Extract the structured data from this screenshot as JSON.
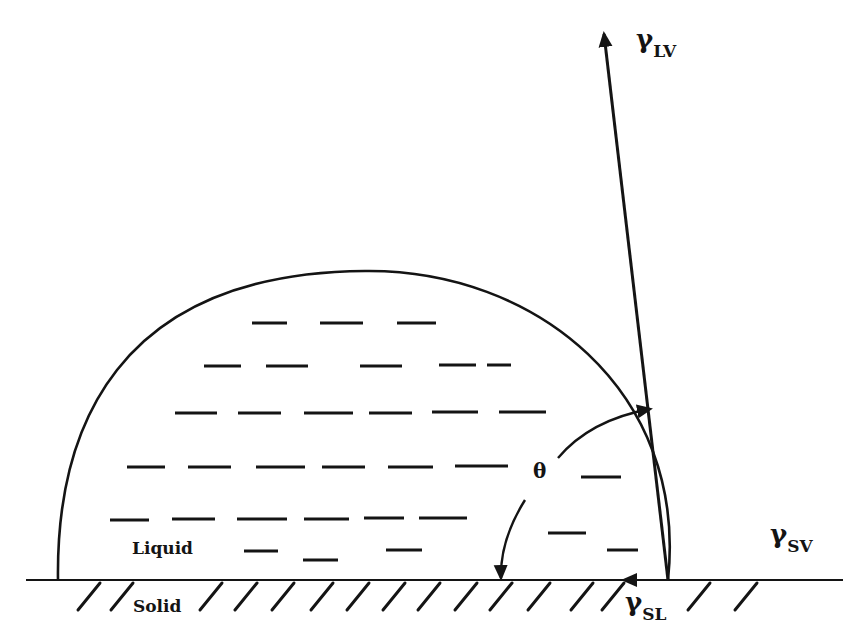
{
  "diagram": {
    "ink_color": "#141414",
    "background": "#ffffff",
    "labels": {
      "gamma_lv": {
        "symbol": "γ",
        "subscript": "LV",
        "x": 636,
        "y": 48
      },
      "gamma_sv": {
        "symbol": "γ",
        "subscript": "SV",
        "x": 770,
        "y": 543
      },
      "gamma_sl": {
        "symbol": "γ",
        "subscript": "SL",
        "x": 625,
        "y": 611
      },
      "theta": {
        "text": "θ",
        "x": 533,
        "y": 478
      },
      "liquid": {
        "text": "Liquid",
        "x": 132,
        "y": 554
      },
      "solid": {
        "text": "Solid",
        "x": 133,
        "y": 612
      }
    },
    "surface": {
      "x1": 26,
      "x2": 843,
      "y": 580
    },
    "drop": {
      "left_x": 58,
      "right_x": 668,
      "base_y": 580,
      "apex_x": 365,
      "apex_y": 271
    },
    "vectors": {
      "lv": {
        "x1": 668,
        "y1": 580,
        "x2": 604,
        "y2": 34
      },
      "sl": {
        "x1": 668,
        "y1": 580,
        "x2": 624,
        "y2": 580
      }
    },
    "angle_arc": {
      "upper": {
        "from": [
          558,
          458
        ],
        "ctrl": [
          590,
          420
        ],
        "to": [
          650,
          409
        ]
      },
      "lower": {
        "from": [
          525,
          500
        ],
        "ctrl": [
          500,
          540
        ],
        "to": [
          501,
          578
        ]
      }
    },
    "hatches": [
      {
        "x": 78
      },
      {
        "x": 111
      },
      {
        "x": 200
      },
      {
        "x": 235
      },
      {
        "x": 272
      },
      {
        "x": 311
      },
      {
        "x": 347
      },
      {
        "x": 383
      },
      {
        "x": 418
      },
      {
        "x": 455
      },
      {
        "x": 490
      },
      {
        "x": 528
      },
      {
        "x": 571
      },
      {
        "x": 602
      },
      {
        "x": 688
      },
      {
        "x": 735
      }
    ],
    "liquid_dashes": [
      {
        "x": 252,
        "y": 323,
        "w": 35
      },
      {
        "x": 320,
        "y": 323,
        "w": 43
      },
      {
        "x": 397,
        "y": 323,
        "w": 39
      },
      {
        "x": 204,
        "y": 366,
        "w": 37
      },
      {
        "x": 266,
        "y": 366,
        "w": 42
      },
      {
        "x": 360,
        "y": 366,
        "w": 42
      },
      {
        "x": 439,
        "y": 365,
        "w": 37
      },
      {
        "x": 487,
        "y": 365,
        "w": 24
      },
      {
        "x": 175,
        "y": 413,
        "w": 42
      },
      {
        "x": 238,
        "y": 413,
        "w": 43
      },
      {
        "x": 304,
        "y": 413,
        "w": 49
      },
      {
        "x": 369,
        "y": 413,
        "w": 43
      },
      {
        "x": 432,
        "y": 412,
        "w": 46
      },
      {
        "x": 499,
        "y": 412,
        "w": 47
      },
      {
        "x": 127,
        "y": 467,
        "w": 38
      },
      {
        "x": 188,
        "y": 467,
        "w": 43
      },
      {
        "x": 256,
        "y": 467,
        "w": 49
      },
      {
        "x": 322,
        "y": 467,
        "w": 43
      },
      {
        "x": 388,
        "y": 467,
        "w": 45
      },
      {
        "x": 455,
        "y": 466,
        "w": 53
      },
      {
        "x": 581,
        "y": 477,
        "w": 40
      },
      {
        "x": 110,
        "y": 520,
        "w": 39
      },
      {
        "x": 172,
        "y": 519,
        "w": 43
      },
      {
        "x": 237,
        "y": 519,
        "w": 50
      },
      {
        "x": 304,
        "y": 519,
        "w": 45
      },
      {
        "x": 364,
        "y": 518,
        "w": 40
      },
      {
        "x": 419,
        "y": 518,
        "w": 48
      },
      {
        "x": 548,
        "y": 533,
        "w": 38
      },
      {
        "x": 244,
        "y": 551,
        "w": 34
      },
      {
        "x": 303,
        "y": 560,
        "w": 35
      },
      {
        "x": 386,
        "y": 550,
        "w": 36
      },
      {
        "x": 607,
        "y": 550,
        "w": 31
      }
    ]
  }
}
